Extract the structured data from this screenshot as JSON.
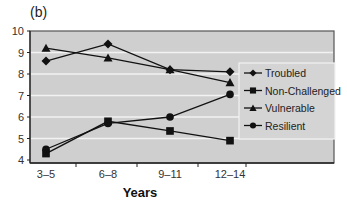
{
  "panel_label": "(b)",
  "chart_data": {
    "type": "line",
    "title": "",
    "xlabel": "Years",
    "ylabel": "",
    "categories": [
      "3–5",
      "6–8",
      "9–11",
      "12–14"
    ],
    "ylim": [
      4,
      10
    ],
    "yticks": [
      4,
      5,
      6,
      7,
      8,
      9,
      10
    ],
    "grid": "horizontal",
    "legend_position": "right-inside",
    "series": [
      {
        "name": "Troubled",
        "marker": "diamond",
        "values": [
          8.6,
          9.4,
          8.2,
          8.1
        ]
      },
      {
        "name": "Non-Challenged",
        "marker": "square",
        "values": [
          4.3,
          5.8,
          5.35,
          4.9
        ]
      },
      {
        "name": "Vulnerable",
        "marker": "triangle",
        "values": [
          9.2,
          8.75,
          8.2,
          7.6
        ]
      },
      {
        "name": "Resilient",
        "marker": "circle",
        "values": [
          4.5,
          5.7,
          6.0,
          7.05
        ]
      }
    ]
  },
  "colors": {
    "plot_background": "#cfcfcf",
    "gridline": "#f2f2f2",
    "series_line": "#111111",
    "legend_background": "#d4d4d4"
  }
}
